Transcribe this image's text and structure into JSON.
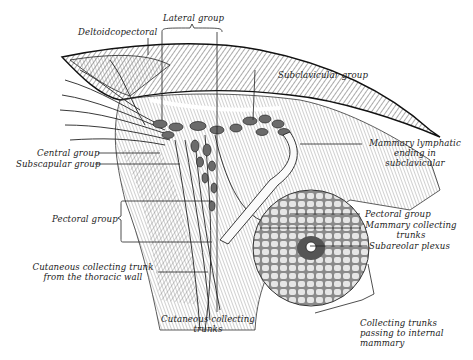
{
  "figure": {
    "labels": {
      "deltoidcopectoral": "Deltoidcopectoral",
      "lateral_group": "Lateral group",
      "subclavicular_group": "Subclavicular group",
      "mammary_lymphatic_1": "Mammary lymphatic",
      "mammary_lymphatic_2": "ending in",
      "mammary_lymphatic_3": "subclavicular",
      "central_group": "Central group",
      "subscapular_group": "Subscapular group",
      "pectoral_group_left": "Pectoral group",
      "pectoral_group_right": "Pectoral group",
      "mammary_collecting_1": "Mammary collecting",
      "mammary_collecting_2": "trunks",
      "subareolar_plexus": "Subareolar plexus",
      "cutaneous_thoracic_1": "Cutaneous collecting trunk",
      "cutaneous_thoracic_2": "from the thoracic wall",
      "cutaneous_trunks_1": "Cutaneous collecting",
      "cutaneous_trunks_2": "trunks",
      "collecting_internal_1": "Collecting trunks",
      "collecting_internal_2": "passing to internal",
      "collecting_internal_3": "mammary"
    }
  }
}
